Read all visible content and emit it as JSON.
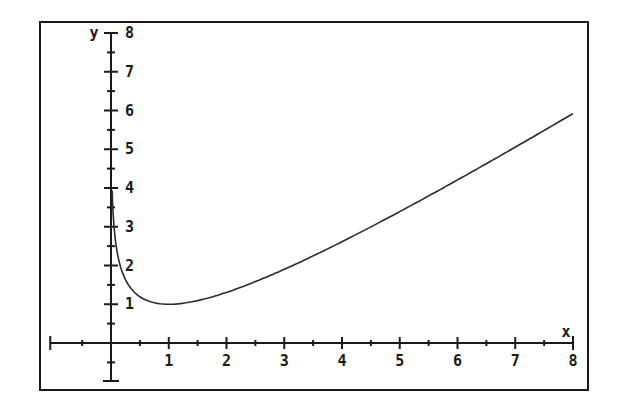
{
  "chart_data": {
    "type": "line",
    "title": "",
    "xlabel": "x",
    "ylabel": "y",
    "function_hint": "y = x - ln(x)",
    "xlim": [
      -1,
      8
    ],
    "ylim": [
      -0.75,
      8
    ],
    "grid": false,
    "legend": null,
    "x_ticks": [
      1,
      2,
      3,
      4,
      5,
      6,
      7,
      8
    ],
    "x_tick_labels": [
      "1",
      "2",
      "3",
      "4",
      "5",
      "6",
      "7",
      "8"
    ],
    "y_ticks": [
      1,
      2,
      3,
      4,
      5,
      6,
      7,
      8
    ],
    "y_tick_labels": [
      "1",
      "2",
      "3",
      "4",
      "5",
      "6",
      "7",
      "8"
    ],
    "series": [
      {
        "name": "curve",
        "x": [
          0.02,
          0.05,
          0.1,
          0.2,
          0.3,
          0.5,
          0.75,
          1,
          1.5,
          2,
          2.5,
          3,
          3.5,
          4,
          4.5,
          5,
          5.5,
          6,
          6.5,
          7,
          7.5,
          8
        ],
        "y": [
          3.93,
          3.05,
          2.4,
          1.81,
          1.5,
          1.19,
          1.04,
          1.0,
          1.09,
          1.31,
          1.58,
          1.9,
          2.25,
          2.61,
          3.0,
          3.39,
          3.8,
          4.21,
          4.63,
          5.05,
          5.49,
          5.92
        ]
      }
    ],
    "colors": {
      "axis": "#1a1a1a",
      "curve": "#2a2a2a",
      "background": "#ffffff"
    }
  }
}
